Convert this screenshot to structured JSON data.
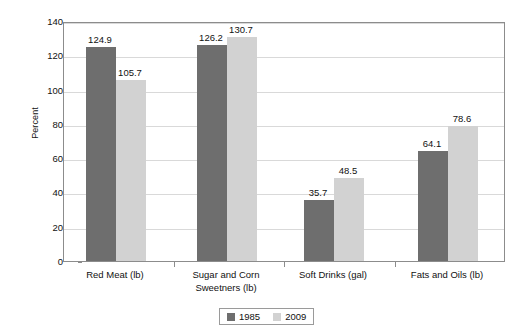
{
  "chart_data": {
    "type": "bar",
    "title": "",
    "subtitle": "",
    "xlabel": "",
    "ylabel": "Percent",
    "ylim": [
      0,
      140
    ],
    "ytick_step": 20,
    "yticks": [
      0,
      20,
      40,
      60,
      80,
      100,
      120,
      140
    ],
    "ytick_labels": [
      "0",
      "20",
      "40",
      "60",
      "80",
      "100",
      "120",
      "140"
    ],
    "grid": true,
    "grid_axis": "y",
    "legend_position": "bottom-center",
    "categories": [
      "Red Meat (lb)",
      "Sugar and Corn\nSweetners (lb)",
      "Soft Drinks (gal)",
      "Fats and Oils (lb)"
    ],
    "category_lines": [
      [
        "Red Meat (lb)"
      ],
      [
        "Sugar and Corn",
        "Sweetners (lb)"
      ],
      [
        "Soft Drinks (gal)"
      ],
      [
        "Fats and Oils (lb)"
      ]
    ],
    "series": [
      {
        "name": "1985",
        "color": "#6e6e6e",
        "values": [
          124.9,
          126.2,
          35.7,
          64.1
        ],
        "value_labels": [
          "124.9",
          "126.2",
          "35.7",
          "64.1"
        ]
      },
      {
        "name": "2009",
        "color": "#d2d2d2",
        "values": [
          105.7,
          130.7,
          48.5,
          78.6
        ],
        "value_labels": [
          "105.7",
          "130.7",
          "48.5",
          "78.6"
        ]
      }
    ]
  },
  "legend": {
    "items": [
      {
        "label": "1985",
        "color": "#6e6e6e"
      },
      {
        "label": "2009",
        "color": "#d2d2d2"
      }
    ]
  },
  "axes": {
    "y_title": "Percent"
  },
  "colors": {
    "series_1985": "#6e6e6e",
    "series_2009": "#d2d2d2",
    "axis_line": "#8c8c8c",
    "gridline": "#d9d9d9",
    "text": "#111111",
    "background": "#ffffff"
  }
}
